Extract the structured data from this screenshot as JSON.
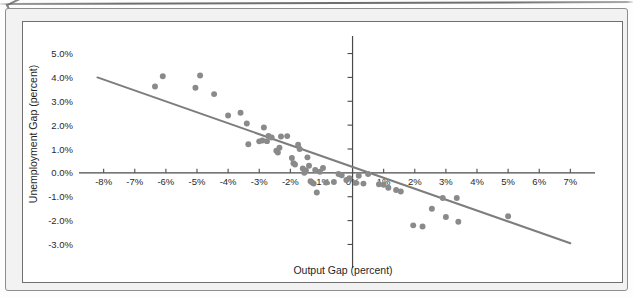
{
  "figure": {
    "background_color": "#f2f2f2",
    "canvas_color": "#ffffff",
    "frame_border_color": "#6f6f6f"
  },
  "chart_data": {
    "type": "scatter",
    "title": "",
    "subtitle": "",
    "xlabel": "Output Gap (percent)",
    "ylabel": "Unemployment Gap (percent)",
    "xlim": [
      -8.6,
      7.6
    ],
    "ylim": [
      -3.4,
      5.4
    ],
    "xticks": [
      -8,
      -7,
      -6,
      -5,
      -4,
      -3,
      -2,
      -1,
      0,
      1,
      2,
      3,
      4,
      5,
      6,
      7
    ],
    "yticks": [
      -3,
      -2,
      -1,
      0,
      1,
      2,
      3,
      4,
      5
    ],
    "xtick_labels": [
      "-8%",
      "-7%",
      "-6%",
      "-5%",
      "-4%",
      "-3%",
      "-2%",
      "-1%",
      "0%",
      "1%",
      "2%",
      "3%",
      "4%",
      "5%",
      "6%",
      "7%"
    ],
    "ytick_labels": [
      "-3.0%",
      "-2.0%",
      "-1.0%",
      "0.0%",
      "1.0%",
      "2.0%",
      "3.0%",
      "4.0%",
      "5.0%"
    ],
    "grid": false,
    "legend": null,
    "marker_color": "#8a8a8a",
    "marker_size": 4.6,
    "trendline": {
      "color": "#7d7d7d",
      "width": 2.0,
      "x_start": -8.2,
      "y_start": 4.0,
      "x_end": 7.0,
      "y_end": -2.95,
      "slope": -0.457,
      "intercept": 0.25
    },
    "points": [
      [
        -6.35,
        3.62
      ],
      [
        -6.1,
        4.05
      ],
      [
        -5.05,
        3.57
      ],
      [
        -4.9,
        4.08
      ],
      [
        -4.45,
        3.3
      ],
      [
        -4.0,
        2.4
      ],
      [
        -3.6,
        2.52
      ],
      [
        -3.4,
        2.07
      ],
      [
        -3.35,
        1.2
      ],
      [
        -3.0,
        1.32
      ],
      [
        -2.9,
        1.36
      ],
      [
        -2.85,
        1.9
      ],
      [
        -2.75,
        1.33
      ],
      [
        -2.7,
        1.55
      ],
      [
        -2.6,
        1.48
      ],
      [
        -2.45,
        0.93
      ],
      [
        -2.4,
        0.85
      ],
      [
        -2.35,
        1.05
      ],
      [
        -2.3,
        1.52
      ],
      [
        -2.1,
        1.54
      ],
      [
        -1.95,
        0.62
      ],
      [
        -1.9,
        0.4
      ],
      [
        -1.85,
        0.35
      ],
      [
        -1.75,
        1.18
      ],
      [
        -1.7,
        1.0
      ],
      [
        -1.6,
        0.18
      ],
      [
        -1.55,
        0.0
      ],
      [
        -1.5,
        0.1
      ],
      [
        -1.45,
        0.65
      ],
      [
        -1.4,
        0.3
      ],
      [
        -1.35,
        -0.35
      ],
      [
        -1.3,
        -0.4
      ],
      [
        -1.25,
        -0.45
      ],
      [
        -1.2,
        0.12
      ],
      [
        -1.15,
        -0.82
      ],
      [
        -1.05,
        0.05
      ],
      [
        -0.95,
        0.2
      ],
      [
        -0.85,
        -0.4
      ],
      [
        -0.6,
        -0.38
      ],
      [
        -0.45,
        -0.05
      ],
      [
        -0.35,
        -0.1
      ],
      [
        -0.2,
        -0.3
      ],
      [
        -0.1,
        -0.22
      ],
      [
        0.1,
        -0.42
      ],
      [
        0.2,
        -0.12
      ],
      [
        0.35,
        -0.45
      ],
      [
        0.5,
        -0.05
      ],
      [
        0.85,
        -0.48
      ],
      [
        1.0,
        -0.5
      ],
      [
        1.15,
        -0.62
      ],
      [
        1.4,
        -0.72
      ],
      [
        1.55,
        -0.78
      ],
      [
        1.95,
        -2.2
      ],
      [
        2.25,
        -2.25
      ],
      [
        2.55,
        -1.5
      ],
      [
        2.9,
        -1.05
      ],
      [
        3.0,
        -1.85
      ],
      [
        3.35,
        -1.05
      ],
      [
        3.4,
        -2.05
      ],
      [
        5.0,
        -1.82
      ]
    ]
  },
  "axis": {
    "x_axis_title": "Output Gap (percent)",
    "y_axis_title": "Unemployment Gap (percent)"
  }
}
